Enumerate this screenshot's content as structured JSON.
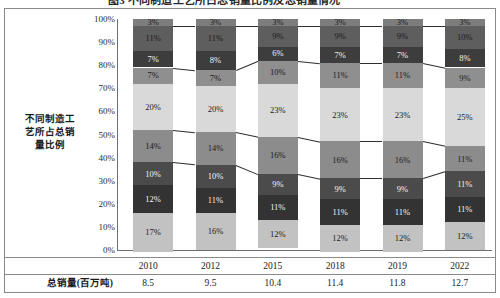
{
  "title": {
    "text": "图3 不同制造工艺所占总销量比例及总销量情况"
  },
  "axis": {
    "y_title": "不同制造工艺所占总销\n量比例",
    "y_title_lines": [
      "不同制造工",
      "艺所占总销",
      "量比例"
    ],
    "y_ticks": [
      "100%",
      "90%",
      "80%",
      "70%",
      "60%",
      "50%",
      "40%",
      "30%",
      "20%",
      "10%",
      "0%"
    ]
  },
  "table": {
    "row_label": "总销量(百万吨)",
    "years": [
      "2010",
      "2012",
      "2015",
      "2018",
      "2019",
      "2022"
    ],
    "totals": [
      "8.5",
      "9.5",
      "10.4",
      "11.4",
      "11.8",
      "12.7"
    ]
  },
  "colors": {
    "s1": "#7d7d7d",
    "s2": "#5e5e5e",
    "s3": "#3d3d3d",
    "s4": "#8f8f8f",
    "s5": "#d9d9d9",
    "s6": "#8c8c8c",
    "s7": "#4b4b4b",
    "s8": "#333333",
    "s9": "#c2c2c2",
    "connector": "#2e2e2e",
    "axis": "#6f6f6f",
    "frame": "#8a8a8a"
  },
  "chart_data": {
    "type": "bar",
    "stacked": true,
    "normalized": true,
    "title": "不同制造工艺所占总销量比例及总销量情况",
    "xlabel": "",
    "ylabel": "不同制造工艺所占总销量比例",
    "ylim": [
      0,
      100
    ],
    "grid": false,
    "legend": "none",
    "categories": [
      "2010",
      "2012",
      "2015",
      "2018",
      "2019",
      "2022"
    ],
    "secondary_axis": {
      "name": "总销量(百万吨)",
      "values": [
        8.5,
        9.5,
        10.4,
        11.4,
        11.8,
        12.7
      ]
    },
    "stack_order": "top-to-bottom",
    "series": [
      {
        "name": "S1",
        "color": "#7d7d7d",
        "values": [
          3,
          3,
          3,
          3,
          3,
          3
        ],
        "labels": [
          "3%",
          "3%",
          "3%",
          "3%",
          "3%",
          "3%"
        ]
      },
      {
        "name": "S2",
        "color": "#5e5e5e",
        "values": [
          11,
          11,
          9,
          9,
          9,
          10
        ],
        "labels": [
          "11%",
          "11%",
          "9%",
          "9%",
          "9%",
          "10%"
        ]
      },
      {
        "name": "S3",
        "color": "#3d3d3d",
        "values": [
          7,
          8,
          6,
          7,
          7,
          8
        ],
        "labels": [
          "7%",
          "8%",
          "6%",
          "7%",
          "7%",
          "8%"
        ]
      },
      {
        "name": "S4",
        "color": "#8f8f8f",
        "values": [
          7,
          7,
          10,
          11,
          11,
          9
        ],
        "labels": [
          "7%",
          "7%",
          "10%",
          "11%",
          "11%",
          "9%"
        ]
      },
      {
        "name": "S5",
        "color": "#d9d9d9",
        "values": [
          20,
          20,
          23,
          23,
          23,
          25
        ],
        "labels": [
          "20%",
          "20%",
          "23%",
          "23%",
          "23%",
          "25%"
        ]
      },
      {
        "name": "S6",
        "color": "#8c8c8c",
        "values": [
          14,
          14,
          16,
          16,
          16,
          11
        ],
        "labels": [
          "14%",
          "14%",
          "16%",
          "16%",
          "16%",
          "11%"
        ]
      },
      {
        "name": "S7",
        "color": "#4b4b4b",
        "values": [
          10,
          10,
          9,
          9,
          9,
          11
        ],
        "labels": [
          "10%",
          "10%",
          "9%",
          "9%",
          "9%",
          "11%"
        ]
      },
      {
        "name": "S8",
        "color": "#333333",
        "values": [
          12,
          11,
          11,
          11,
          11,
          11
        ],
        "labels": [
          "12%",
          "11%",
          "11%",
          "11%",
          "11%",
          "11%"
        ]
      },
      {
        "name": "S9",
        "color": "#c2c2c2",
        "values": [
          17,
          16,
          12,
          12,
          12,
          12
        ],
        "labels": [
          "17%",
          "16%",
          "12%",
          "12%",
          "12%",
          "12%"
        ]
      }
    ],
    "connector_boundaries_after_series": [
      1,
      3,
      5,
      6
    ]
  }
}
